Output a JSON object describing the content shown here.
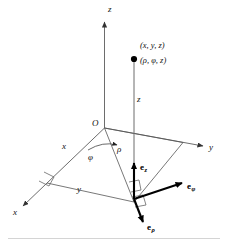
{
  "figure": {
    "background_color": "#ffffff",
    "ink_color": "#111111",
    "axis_color": "#6d6d6d",
    "vector_color": "#000000"
  },
  "axes": {
    "z_label": "z",
    "y_label": "y",
    "x_label": "x",
    "origin_label": "O"
  },
  "point": {
    "cartesian_label": "(x, y, z)",
    "cylindrical_label": "(ρ, φ, z)"
  },
  "measures": {
    "height_label": "z",
    "radial_label": "ρ",
    "angle_label": "φ",
    "x_projection_label": "x",
    "y_projection_label": "y"
  },
  "unit_vectors": [
    {
      "name": "e-z",
      "base": "e",
      "sub": "z",
      "direction": "up"
    },
    {
      "name": "e-phi",
      "base": "e",
      "sub": "φ",
      "direction": "right"
    },
    {
      "name": "e-rho",
      "base": "e",
      "sub": "ρ",
      "direction": "down-left"
    }
  ]
}
